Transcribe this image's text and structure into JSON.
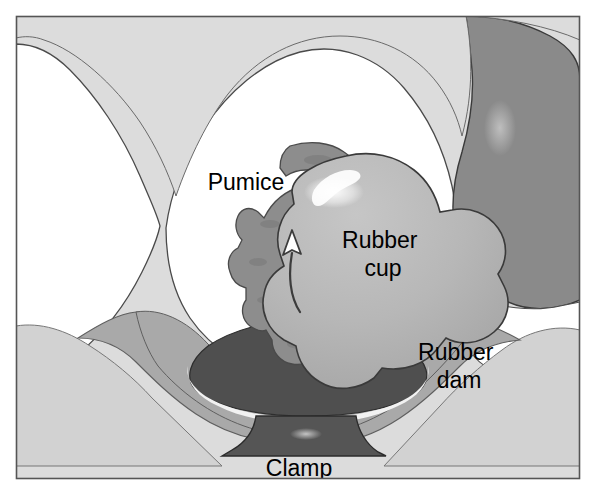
{
  "figure": {
    "type": "medical-illustration",
    "width": 596,
    "height": 495,
    "frame": {
      "border_color": "#555555",
      "background_color": "#ffffff",
      "inset_background": "#d9d9d9"
    },
    "labels": [
      {
        "id": "pumice",
        "text": "Pumice",
        "x": 246,
        "y": 190,
        "lines": [
          "Pumice"
        ]
      },
      {
        "id": "rubber_cup",
        "text": "Rubber cup",
        "x": 383,
        "y": 248,
        "lines": [
          "Rubber",
          "cup"
        ]
      },
      {
        "id": "rubber_dam",
        "text": "Rubber dam",
        "x": 459,
        "y": 360,
        "lines": [
          "Rubber",
          "dam"
        ]
      },
      {
        "id": "clamp",
        "text": "Clamp",
        "x": 299,
        "y": 474,
        "lines": [
          "Clamp"
        ]
      }
    ],
    "annotations": [
      {
        "id": "rotation-arrow",
        "description": "curved arrow indicating rubber cup rotation direction",
        "color": "#ffffff",
        "stroke": "#3c3c3c"
      }
    ],
    "colors": {
      "tooth_white": "#ffffff",
      "gingiva_light": "#d8d8d8",
      "background_light": "#dcdcdc",
      "rubber_dam_light": "#d2d2d2",
      "rubber_dam_mid": "#a9a9a9",
      "rubber_cup": "#b6b6b6",
      "pumice": "#8d8d8d",
      "adjacent_tooth_dark": "#8a8a8a",
      "clamp_dark": "#555555",
      "sulcus_dark": "#4f4f4f",
      "outline": "#3a3a3a",
      "highlight": "#ffffff"
    }
  }
}
